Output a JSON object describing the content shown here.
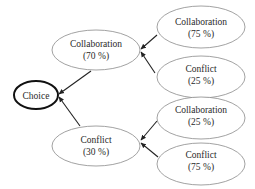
{
  "diagram": {
    "type": "decision-tree",
    "direction": "right-to-left",
    "colors": {
      "node_stroke": "#8a8a8a",
      "root_stroke": "#111111",
      "edge": "#222222",
      "text": "#2a2a2a"
    },
    "root": {
      "id": "choice",
      "label": "Choice"
    },
    "level1": [
      {
        "id": "collab-70",
        "label": "Collaboration",
        "percent": "(70 %)"
      },
      {
        "id": "conflict-30",
        "label": "Conflict",
        "percent": "(30 %)"
      }
    ],
    "level2": [
      {
        "id": "collab-75",
        "parent": "collab-70",
        "label": "Collaboration",
        "percent": "(75 %)"
      },
      {
        "id": "conflict-25",
        "parent": "collab-70",
        "label": "Conflict",
        "percent": "(25 %)"
      },
      {
        "id": "collab-25",
        "parent": "conflict-30",
        "label": "Collaboration",
        "percent": "(25 %)"
      },
      {
        "id": "conflict-75",
        "parent": "conflict-30",
        "label": "Conflict",
        "percent": "(75 %)"
      }
    ],
    "edges": [
      {
        "from": "collab-70",
        "to": "choice"
      },
      {
        "from": "conflict-30",
        "to": "choice"
      },
      {
        "from": "collab-75",
        "to": "collab-70"
      },
      {
        "from": "conflict-25",
        "to": "collab-70"
      },
      {
        "from": "collab-25",
        "to": "conflict-30"
      },
      {
        "from": "conflict-75",
        "to": "conflict-30"
      }
    ]
  }
}
